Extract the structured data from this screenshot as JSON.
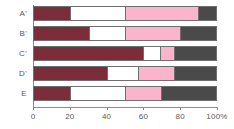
{
  "chart_data": {
    "type": "bar",
    "orientation": "horizontal",
    "stacked": true,
    "normalized_percent": true,
    "title": "",
    "subtitle": "",
    "xlabel": "",
    "ylabel": "",
    "xlim": [
      0,
      100
    ],
    "grid": false,
    "legend": null,
    "axis_unit_suffix": "%",
    "categories": [
      "A'",
      "B'",
      "C'",
      "D'",
      "E"
    ],
    "tick_values": [
      0,
      20,
      40,
      60,
      80,
      100
    ],
    "tick_labels": [
      "0",
      "20",
      "40",
      "60",
      "80",
      "100%"
    ],
    "series": [
      {
        "name": "segment-1",
        "color": "#7b2e3a",
        "values": [
          20,
          30,
          60,
          40,
          20
        ]
      },
      {
        "name": "segment-2",
        "color": "#ffffff",
        "values": [
          30,
          20,
          9,
          17,
          30
        ]
      },
      {
        "name": "segment-3",
        "color": "#fab4cc",
        "values": [
          40,
          30,
          8,
          20,
          20
        ]
      },
      {
        "name": "segment-4",
        "color": "#4a4a4a",
        "values": [
          10,
          20,
          23,
          23,
          30
        ]
      }
    ],
    "rows": [
      {
        "label": "A'",
        "segments": [
          20,
          30,
          40,
          10
        ]
      },
      {
        "label": "B'",
        "segments": [
          30,
          20,
          30,
          20
        ]
      },
      {
        "label": "C'",
        "segments": [
          60,
          9,
          8,
          23
        ]
      },
      {
        "label": "D'",
        "segments": [
          40,
          17,
          20,
          23
        ]
      },
      {
        "label": "E",
        "segments": [
          20,
          30,
          20,
          30
        ]
      }
    ]
  },
  "colors": {
    "segment_1": "#7b2e3a",
    "segment_2": "#ffffff",
    "segment_3": "#fab4cc",
    "segment_4": "#4a4a4a",
    "axis": "#8a8a8a",
    "text": "#5a5a5a",
    "background": "#ffffff",
    "bar_border": "#6f6f6f"
  }
}
